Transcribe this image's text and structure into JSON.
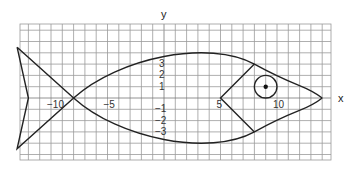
{
  "diagram": {
    "axes": {
      "x_label": "x",
      "y_label": "y",
      "x_ticks": [
        {
          "value": -10,
          "label": "-10"
        },
        {
          "value": -5,
          "label": "-5"
        },
        {
          "value": 5,
          "label": "5"
        },
        {
          "value": 10,
          "label": "10"
        }
      ],
      "y_ticks": [
        {
          "value": 3,
          "label": "3"
        },
        {
          "value": 2,
          "label": "2"
        },
        {
          "value": 1,
          "label": "1"
        },
        {
          "value": -1,
          "label": "-1"
        },
        {
          "value": -2,
          "label": "-2"
        },
        {
          "value": -3,
          "label": "-3"
        }
      ]
    },
    "grid": {
      "x_min": -13,
      "x_max": 14.5,
      "y_min": -5.5,
      "y_max": 6.5,
      "step": 1
    },
    "shapes": {
      "body_upper_curve": "from (-8,0) up through (0,4) down to (14,0)",
      "body_lower_curve": "from (-8,0) down through (0,-4) up to (14,0)",
      "tail": [
        [
          -13,
          4.5
        ],
        [
          -8,
          0
        ],
        [
          -13,
          -4.5
        ],
        [
          -12,
          0
        ]
      ],
      "gill": [
        [
          8,
          3
        ],
        [
          5,
          0
        ],
        [
          8,
          -3
        ]
      ],
      "eye": {
        "center": [
          9,
          1
        ],
        "radius": 1,
        "pupil": true
      }
    },
    "colors": {
      "grid": "#9a9a9a",
      "lines": "#222222",
      "background": "#ffffff"
    }
  }
}
